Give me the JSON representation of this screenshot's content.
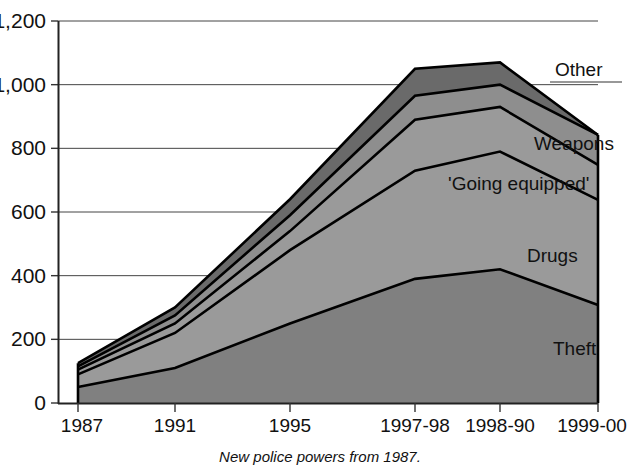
{
  "chart_data": {
    "type": "area",
    "stacked": true,
    "title": "",
    "subtitle": "",
    "xlabel": "",
    "ylabel": "",
    "caption": "New police powers from 1987.",
    "categories": [
      "1987",
      "1991",
      "1995",
      "1997-98",
      "1998-90",
      "1999-00"
    ],
    "ytick_labels": [
      "0",
      "200",
      "400",
      "600",
      "800",
      "1,000",
      "1,200"
    ],
    "ytick_values": [
      0,
      200,
      400,
      600,
      800,
      1000,
      1200
    ],
    "ylim": [
      0,
      1200
    ],
    "grid": true,
    "legend_position": "inline-right",
    "series": [
      {
        "name": "Theft",
        "values": [
          50,
          110,
          250,
          390,
          420,
          308
        ],
        "color": "#808080"
      },
      {
        "name": "Drugs",
        "values": [
          40,
          110,
          230,
          340,
          370,
          330
        ],
        "color": "#9a9a9a"
      },
      {
        "name": "'Going equipped'",
        "values": [
          15,
          30,
          60,
          160,
          140,
          110
        ],
        "color": "#9a9a9a"
      },
      {
        "name": "Weapons",
        "values": [
          10,
          25,
          50,
          75,
          70,
          94
        ],
        "color": "#8e8e8e"
      },
      {
        "name": "Other",
        "values": [
          10,
          25,
          50,
          85,
          70,
          0
        ],
        "color": "#6a6a6a"
      }
    ],
    "cumulative_totals": {
      "Theft": [
        50,
        110,
        250,
        390,
        420,
        308
      ],
      "Drugs": [
        90,
        220,
        480,
        730,
        790,
        638
      ],
      "'Going equipped'": [
        105,
        250,
        540,
        890,
        930,
        748
      ],
      "Weapons": [
        115,
        275,
        590,
        965,
        1000,
        842
      ],
      "Other": [
        125,
        300,
        640,
        1050,
        1070,
        842
      ]
    },
    "series_labels": [
      {
        "name": "Other",
        "text": "Other"
      },
      {
        "name": "Weapons",
        "text": "Weapons"
      },
      {
        "name": "'Going equipped'",
        "text": "'Going equipped'"
      },
      {
        "name": "Drugs",
        "text": "Drugs"
      },
      {
        "name": "Theft",
        "text": "Theft"
      }
    ]
  },
  "colors": {
    "background": "#ffffff",
    "axis": "#222222",
    "grid": "#444444",
    "outline": "#000000"
  }
}
